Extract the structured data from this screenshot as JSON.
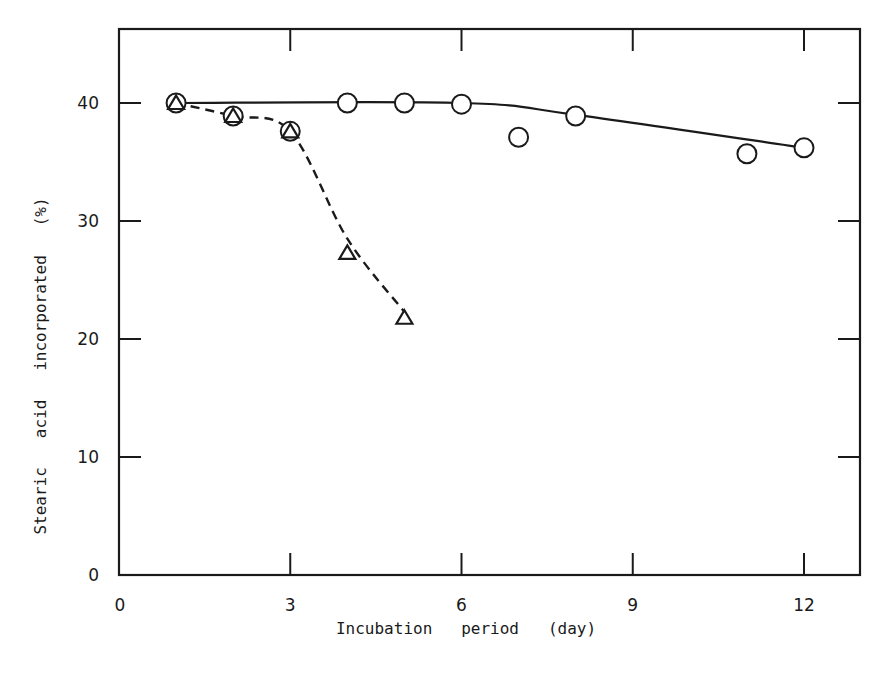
{
  "chart_data": {
    "type": "line",
    "title": "",
    "xlabel": "Incubation   period   (day)",
    "ylabel": "Stearic   acid   incorporated   (%)",
    "xlim": [
      0,
      13
    ],
    "ylim": [
      0,
      45
    ],
    "x_ticks": [
      0,
      3,
      6,
      9,
      12
    ],
    "y_ticks": [
      0,
      10,
      20,
      30,
      40
    ],
    "x_tick_labels": [
      "0",
      "3",
      "6",
      "9",
      "12"
    ],
    "y_tick_labels": [
      "0",
      "10",
      "20",
      "30",
      "40"
    ],
    "grid": false,
    "legend": null,
    "series": [
      {
        "name": "circles (solid line)",
        "marker": "circle",
        "line_style": "solid",
        "x": [
          1,
          2,
          3,
          4,
          5,
          6,
          7,
          8,
          11,
          12
        ],
        "y": [
          40.0,
          38.9,
          37.6,
          40.0,
          40.0,
          39.9,
          37.1,
          38.9,
          35.7,
          36.2
        ],
        "fit_curve": {
          "x": [
            1,
            6,
            8,
            12
          ],
          "y": [
            40.0,
            40.0,
            39.0,
            36.2
          ]
        }
      },
      {
        "name": "triangles (dashed line)",
        "marker": "triangle",
        "line_style": "dashed",
        "x": [
          1,
          2,
          3,
          4,
          5
        ],
        "y": [
          40.0,
          38.9,
          37.6,
          27.3,
          21.8
        ],
        "fit_curve": {
          "x": [
            1,
            2,
            3,
            4,
            5
          ],
          "y": [
            40.0,
            38.9,
            37.6,
            28.5,
            22.3
          ]
        }
      }
    ]
  },
  "axes": {
    "x_title": "Incubation   period   (day)",
    "y_title": "Stearic   acid   incorporated   (%)"
  }
}
